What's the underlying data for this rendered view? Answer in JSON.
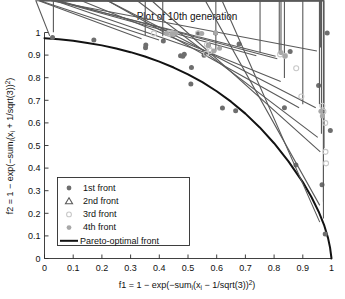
{
  "chart_data": {
    "type": "scatter",
    "title": "Plot of 10th generation",
    "xlabel": "f1 = 1 − exp(−sumᵢ(xᵢ − 1/sqrt(3))²)",
    "ylabel": "f2 = 1 − exp(−sumᵢ(xᵢ + 1/sqrt(3))²)",
    "xlim": [
      0,
      1
    ],
    "ylim": [
      0,
      1
    ],
    "grid": false,
    "legend_position": "lower-left",
    "xticks": [
      "0",
      "0.1",
      "0.2",
      "0.3",
      "0.4",
      "0.5",
      "0.6",
      "0.7",
      "0.8",
      "0.9",
      "1"
    ],
    "yticks": [
      "0",
      "0.1",
      "0.2",
      "0.3",
      "0.4",
      "0.5",
      "0.6",
      "0.7",
      "0.8",
      "0.9",
      "1"
    ],
    "xtick_values": [
      0,
      0.1,
      0.2,
      0.3,
      0.4,
      0.5,
      0.6,
      0.7,
      0.8,
      0.9,
      1
    ],
    "ytick_values": [
      0,
      0.1,
      0.2,
      0.3,
      0.4,
      0.5,
      0.6,
      0.7,
      0.8,
      0.9,
      1
    ],
    "colors": {
      "front1": "#6e6e6e",
      "front2": "#5a5a5a",
      "front3": "#c8c8c8",
      "front4": "#a8a8a8",
      "pareto": "#121212",
      "axis": "#2b2b2b",
      "background": "#ffffff"
    },
    "series": [
      {
        "name": "1st front",
        "marker": "filled-circle",
        "color": "#6e6e6e",
        "points": [
          [
            0.028,
            0.978
          ],
          [
            0.172,
            0.967
          ],
          [
            0.352,
            0.932
          ],
          [
            0.353,
            0.945
          ],
          [
            0.414,
            0.962
          ],
          [
            0.446,
            0.997
          ],
          [
            0.452,
            0.992
          ],
          [
            0.455,
            0.997
          ],
          [
            0.474,
            0.897
          ],
          [
            0.482,
            0.895
          ],
          [
            0.487,
            0.904
          ],
          [
            0.512,
            0.845
          ],
          [
            0.536,
            0.998
          ],
          [
            0.556,
            0.899
          ],
          [
            0.571,
            0.944
          ],
          [
            0.596,
            0.998
          ],
          [
            0.51,
            0.772
          ],
          [
            0.62,
            0.666
          ],
          [
            0.666,
            0.654
          ],
          [
            0.678,
            0.949
          ],
          [
            0.836,
            0.667
          ],
          [
            0.856,
            0.916
          ],
          [
            0.876,
            0.414
          ],
          [
            0.955,
            0.766
          ],
          [
            0.967,
            0.326
          ],
          [
            0.978,
            0.108
          ],
          [
            0.996,
            0.566
          ],
          [
            0.985,
            0.998
          ]
        ]
      },
      {
        "name": "2nd front",
        "marker": "triangle",
        "color": "#5a5a5a",
        "points": [
          [
            0.031,
            0.985
          ],
          [
            0.351,
            0.972
          ],
          [
            0.412,
            0.967
          ],
          [
            0.597,
            0.9
          ],
          [
            0.751,
            0.897
          ],
          [
            0.818,
            0.895
          ],
          [
            0.824,
            0.884
          ],
          [
            0.836,
            0.783
          ],
          [
            0.9,
            0.667
          ],
          [
            0.958,
            0.667
          ],
          [
            0.965,
            0.536
          ],
          [
            0.974,
            0.472
          ],
          [
            0.972,
            0.235
          ],
          [
            0.972,
            0.161
          ],
          [
            0.962,
            0.918
          ]
        ]
      },
      {
        "name": "3rd front",
        "marker": "open-circle",
        "color": "#c8c8c8",
        "points": [
          [
            0.381,
            0.996
          ],
          [
            0.433,
            0.995
          ],
          [
            0.438,
            0.996
          ],
          [
            0.446,
            0.996
          ],
          [
            0.535,
            0.996
          ],
          [
            0.566,
            0.946
          ],
          [
            0.575,
            0.926
          ],
          [
            0.578,
            0.918
          ],
          [
            0.563,
            0.906
          ],
          [
            0.821,
            0.903
          ],
          [
            0.838,
            0.897
          ],
          [
            0.877,
            0.842
          ],
          [
            0.895,
            0.717
          ],
          [
            0.968,
            0.676
          ],
          [
            0.972,
            0.65
          ],
          [
            0.978,
            0.6
          ],
          [
            0.979,
            0.472
          ],
          [
            0.981,
            0.421
          ]
        ]
      },
      {
        "name": "4th front",
        "marker": "filled-circle-light",
        "color": "#a8a8a8",
        "points": [
          [
            0.425,
            0.996
          ],
          [
            0.444,
            0.995
          ],
          [
            0.458,
            0.997
          ],
          [
            0.548,
            0.996
          ],
          [
            0.571,
            0.942
          ],
          [
            0.61,
            0.93
          ],
          [
            0.59,
            0.918
          ],
          [
            0.824,
            0.912
          ],
          [
            0.963,
            0.652
          ],
          [
            0.968,
            0.63
          ],
          [
            0.838,
            0.896
          ],
          [
            0.596,
            0.999
          ]
        ]
      }
    ],
    "pareto_front": {
      "name": "Pareto-optimal front",
      "style": "solid-line",
      "color": "#121212",
      "description": "Concave-to-convex curve from (0, 0.975) descending to (1, 0)",
      "points": [
        [
          0.0,
          0.975
        ],
        [
          0.05,
          0.97
        ],
        [
          0.1,
          0.963
        ],
        [
          0.15,
          0.954
        ],
        [
          0.2,
          0.943
        ],
        [
          0.25,
          0.929
        ],
        [
          0.3,
          0.913
        ],
        [
          0.35,
          0.894
        ],
        [
          0.4,
          0.871
        ],
        [
          0.45,
          0.845
        ],
        [
          0.5,
          0.815
        ],
        [
          0.55,
          0.78
        ],
        [
          0.6,
          0.74
        ],
        [
          0.65,
          0.694
        ],
        [
          0.7,
          0.641
        ],
        [
          0.75,
          0.58
        ],
        [
          0.8,
          0.51
        ],
        [
          0.85,
          0.43
        ],
        [
          0.9,
          0.338
        ],
        [
          0.93,
          0.272
        ],
        [
          0.955,
          0.208
        ],
        [
          0.975,
          0.145
        ],
        [
          0.988,
          0.09
        ],
        [
          0.995,
          0.048
        ],
        [
          1.0,
          0.0
        ]
      ]
    },
    "legend_entries": [
      {
        "label": "1st front",
        "marker": "filled-circle",
        "color": "#6e6e6e"
      },
      {
        "label": "2nd front",
        "marker": "triangle",
        "color": "#5a5a5a"
      },
      {
        "label": "3rd front",
        "marker": "open-circle",
        "color": "#c8c8c8"
      },
      {
        "label": "4th front",
        "marker": "filled-circle-light",
        "color": "#a8a8a8"
      },
      {
        "label": "Pareto-optimal front",
        "marker": "line",
        "color": "#121212"
      }
    ]
  },
  "axis_label_parts": {
    "x": {
      "pre": "f1 = 1 − exp(−sum",
      "sub1": "i",
      "mid": "(x",
      "sub2": "i",
      "post": " − 1/sqrt(3))",
      "sup": "2",
      "tail": ")"
    },
    "y": {
      "pre": "f2 = 1 − exp(−sum",
      "sub1": "i",
      "mid": "(x",
      "sub2": "i",
      "post": " + 1/sqrt(3))",
      "sup": "2",
      "tail": ")"
    }
  }
}
